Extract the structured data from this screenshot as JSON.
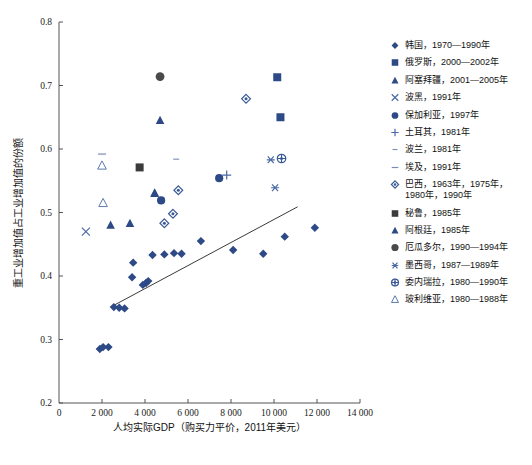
{
  "chart_data": {
    "type": "scatter",
    "title": "",
    "xlabel": "人均实际GDP（购买力平价，2011年美元）",
    "ylabel": "重工业增加值占工业增加值的份额",
    "xlim": [
      0,
      14000
    ],
    "ylim": [
      0.2,
      0.8
    ],
    "xticks": [
      "0",
      "2 000",
      "4 000",
      "6 000",
      "8 000",
      "10 000",
      "12 000",
      "14 000"
    ],
    "xtick_values": [
      0,
      2000,
      4000,
      6000,
      8000,
      10000,
      12000,
      14000
    ],
    "yticks": [
      "0.2",
      "0.3",
      "0.4",
      "0.5",
      "0.6",
      "0.7",
      "0.8"
    ],
    "ytick_values": [
      0.2,
      0.3,
      0.4,
      0.5,
      0.6,
      0.7,
      0.8
    ],
    "grid": false,
    "legend_position": "right",
    "trendline": {
      "x1": 2450,
      "y1": 0.352,
      "x2": 11100,
      "y2": 0.509
    },
    "series": [
      {
        "name": "韩国",
        "label": "韩国，1970—1990年",
        "marker": "diamond-filled",
        "color": "#2e4a86",
        "points": [
          [
            1900,
            0.285
          ],
          [
            2050,
            0.288
          ],
          [
            2300,
            0.288
          ],
          [
            2550,
            0.351
          ],
          [
            2800,
            0.35
          ],
          [
            3050,
            0.349
          ],
          [
            3400,
            0.398
          ],
          [
            3450,
            0.421
          ],
          [
            3900,
            0.386
          ],
          [
            4050,
            0.389
          ],
          [
            4150,
            0.392
          ],
          [
            4350,
            0.433
          ],
          [
            4900,
            0.434
          ],
          [
            5350,
            0.436
          ],
          [
            5700,
            0.435
          ],
          [
            6600,
            0.455
          ],
          [
            8100,
            0.441
          ],
          [
            9500,
            0.435
          ],
          [
            10500,
            0.462
          ],
          [
            11900,
            0.476
          ]
        ]
      },
      {
        "name": "俄罗斯",
        "label": "俄罗斯，2000—2002年",
        "marker": "square-filled",
        "color": "#2e4a86",
        "points": [
          [
            10150,
            0.713
          ],
          [
            10300,
            0.65
          ]
        ]
      },
      {
        "name": "阿塞拜疆",
        "label": "阿塞拜疆，2001—2005年",
        "marker": "triangle-filled",
        "color": "#2e4a86",
        "points": [
          [
            4700,
            0.645
          ],
          [
            4450,
            0.53
          ],
          [
            3300,
            0.483
          ],
          [
            2400,
            0.48
          ]
        ]
      },
      {
        "name": "波黑",
        "label": "波黑，1991年",
        "marker": "x-cross",
        "color": "#4a6aa5",
        "points": [
          [
            1250,
            0.47
          ]
        ]
      },
      {
        "name": "保加利亚",
        "label": "保加利亚，1997年",
        "marker": "circle-filled",
        "color": "#2e4a86",
        "points": [
          [
            4750,
            0.519
          ],
          [
            7450,
            0.554
          ]
        ]
      },
      {
        "name": "土耳其",
        "label": "土耳其，1981年",
        "marker": "plus",
        "color": "#4a6aa5",
        "points": [
          [
            7800,
            0.559
          ]
        ]
      },
      {
        "name": "波兰",
        "label": "波兰，1981年",
        "marker": "dash-small",
        "color": "#7a8bb5",
        "points": [
          [
            5450,
            0.584
          ]
        ]
      },
      {
        "name": "埃及",
        "label": "埃及，1991年",
        "marker": "dash",
        "color": "#7a8bb5",
        "points": [
          [
            2000,
            0.592
          ]
        ]
      },
      {
        "name": "巴西",
        "label": "巴西，1963年，1975年，\n          1980年，1990年",
        "marker": "diamond-open",
        "color": "#3a5a96",
        "points": [
          [
            5550,
            0.535
          ],
          [
            5300,
            0.498
          ],
          [
            4900,
            0.483
          ],
          [
            8700,
            0.679
          ]
        ]
      },
      {
        "name": "秘鲁",
        "label": "秘鲁，1985年",
        "marker": "square-dark",
        "color": "#3b3b3b",
        "points": [
          [
            3750,
            0.571
          ]
        ]
      },
      {
        "name": "阿根廷",
        "label": "阿根廷，1985年",
        "marker": "triangle-filled",
        "color": "#2e4a86",
        "points": [
          [
            4450,
            0.531
          ]
        ]
      },
      {
        "name": "厄瓜多尔",
        "label": "厄瓜多尔，1990—1994年",
        "marker": "circle-dark",
        "color": "#4a4a4a",
        "points": [
          [
            4700,
            0.714
          ]
        ]
      },
      {
        "name": "墨西哥",
        "label": "墨西哥，1987—1989年",
        "marker": "asterisk",
        "color": "#4a6aa5",
        "points": [
          [
            9850,
            0.583
          ],
          [
            10050,
            0.539
          ]
        ]
      },
      {
        "name": "委内瑞拉",
        "label": "委内瑞拉，1980—1990年",
        "marker": "circle-open",
        "color": "#3a5a96",
        "points": [
          [
            10350,
            0.585
          ]
        ]
      },
      {
        "name": "玻利维亚",
        "label": "玻利维亚，1980—1988年",
        "marker": "triangle-open",
        "color": "#5b79ad",
        "points": [
          [
            2000,
            0.574
          ],
          [
            2050,
            0.515
          ]
        ]
      }
    ]
  },
  "legend": {
    "items": [
      {
        "marker": "diamond-filled",
        "label": "韩国，1970—1990年"
      },
      {
        "marker": "square-filled",
        "label": "俄罗斯，2000—2002年"
      },
      {
        "marker": "triangle-filled",
        "label": "阿塞拜疆，2001—2005年"
      },
      {
        "marker": "x-cross",
        "label": "波黑，1991年"
      },
      {
        "marker": "circle-filled",
        "label": "保加利亚，1997年"
      },
      {
        "marker": "plus",
        "label": "土耳其，1981年"
      },
      {
        "marker": "dash-small",
        "label": "波兰，1981年"
      },
      {
        "marker": "dash",
        "label": "埃及，1991年"
      },
      {
        "marker": "diamond-open",
        "label": "巴西，1963年，1975年，\n1980年，1990年"
      },
      {
        "marker": "square-dark",
        "label": "秘鲁，1985年"
      },
      {
        "marker": "triangle-filled",
        "label": "阿根廷，1985年"
      },
      {
        "marker": "circle-dark",
        "label": "厄瓜多尔，1990—1994年"
      },
      {
        "marker": "asterisk",
        "label": "墨西哥，1987—1989年"
      },
      {
        "marker": "circle-open",
        "label": "委内瑞拉，1980—1990年"
      },
      {
        "marker": "triangle-open",
        "label": "玻利维亚，1980—1988年"
      }
    ]
  },
  "colors": {
    "primary": "#2e4a86",
    "secondary": "#4a6aa5",
    "light": "#7a8bb5",
    "dark": "#3b3b3b",
    "axis": "#555555",
    "trend": "#3a3a3a"
  }
}
